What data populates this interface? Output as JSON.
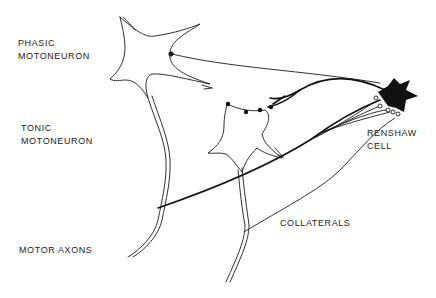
{
  "diagram": {
    "labels": {
      "phasic_line1": "PHASIC",
      "phasic_line2": "MOTONEURON",
      "tonic_line1": "TONIC",
      "tonic_line2": "MOTONEURON",
      "renshaw_line1": "RENSHAW",
      "renshaw_line2": "CELL",
      "collaterals": "COLLATERALS",
      "motor_axons": "MOTOR AXONS"
    },
    "colors": {
      "ink": "#1a1a1a",
      "background": "#ffffff"
    }
  }
}
